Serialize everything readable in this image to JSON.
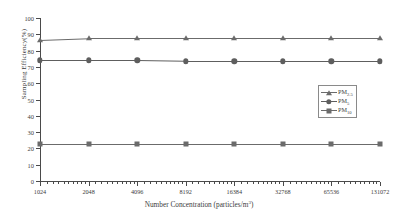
{
  "chart_data": {
    "type": "line",
    "title": "",
    "xlabel": "Number Concentration (particles/m",
    "xlabel_sup": "3",
    "xlabel_tail": ")",
    "ylabel": "Sampling Efficiency(%)",
    "x": [
      1024,
      2048,
      4096,
      8192,
      16384,
      32768,
      65536,
      131072
    ],
    "xtick_labels": [
      "1024",
      "2048",
      "4096",
      "8192",
      "16384",
      "32768",
      "65536",
      "131072"
    ],
    "xscale": "log2",
    "ylim": [
      0,
      100
    ],
    "ytick_labels": [
      "0",
      "10",
      "20",
      "30",
      "40",
      "50",
      "60",
      "70",
      "80",
      "90",
      "100"
    ],
    "ytick_values": [
      0,
      10,
      20,
      30,
      40,
      50,
      60,
      70,
      80,
      90,
      100
    ],
    "grid": false,
    "legend_position": "right-middle",
    "series": [
      {
        "name": "PM2.5",
        "label_base": "PM",
        "label_sub": "2.5",
        "marker": "triangle",
        "color": "#6b6b6b",
        "values": [
          86.5,
          87.5,
          87.5,
          87.5,
          87.5,
          87.5,
          87.5,
          87.5
        ]
      },
      {
        "name": "PM5",
        "label_base": "PM",
        "label_sub": "5",
        "marker": "circle",
        "color": "#5e5e5e",
        "values": [
          74.0,
          74.0,
          74.0,
          73.5,
          73.5,
          73.5,
          73.5,
          73.5
        ]
      },
      {
        "name": "PM10",
        "label_base": "PM",
        "label_sub": "10",
        "marker": "square",
        "color": "#6b6b6b",
        "values": [
          22.5,
          22.5,
          22.5,
          22.5,
          22.5,
          22.5,
          22.5,
          22.5
        ]
      }
    ]
  }
}
